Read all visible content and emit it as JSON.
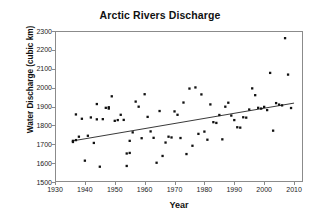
{
  "chart_data": {
    "type": "scatter",
    "title": "Arctic Rivers Discharge",
    "xlabel": "Year",
    "ylabel": "Water Discharge (cubic km)",
    "xlim": [
      1930,
      2013
    ],
    "ylim": [
      1500,
      2300
    ],
    "xticks": [
      1930,
      1940,
      1950,
      1960,
      1970,
      1980,
      1990,
      2000,
      2010
    ],
    "yticks": [
      1500,
      1600,
      1700,
      1800,
      1900,
      2000,
      2100,
      2200,
      2300
    ],
    "grid": false,
    "legend": null,
    "marker_color": "#111111",
    "marker_shape": "square",
    "frame_color": "#8b8b8b",
    "series": [
      {
        "name": "Annual discharge",
        "x": [
          1936,
          1936,
          1937,
          1937,
          1938,
          1939,
          1940,
          1941,
          1942,
          1943,
          1944,
          1944,
          1945,
          1946,
          1947,
          1948,
          1948,
          1949,
          1950,
          1951,
          1952,
          1953,
          1954,
          1954,
          1955,
          1955,
          1956,
          1957,
          1958,
          1959,
          1960,
          1961,
          1962,
          1963,
          1964,
          1965,
          1966,
          1967,
          1968,
          1969,
          1970,
          1971,
          1972,
          1973,
          1974,
          1975,
          1976,
          1977,
          1978,
          1979,
          1980,
          1981,
          1982,
          1983,
          1984,
          1985,
          1986,
          1987,
          1988,
          1989,
          1990,
          1991,
          1992,
          1993,
          1994,
          1995,
          1996,
          1997,
          1998,
          1999,
          2000,
          2001,
          2002,
          2003,
          2004,
          2005,
          2006,
          2007,
          2008,
          2009
        ],
        "y": [
          1718,
          1712,
          1722,
          1858,
          1740,
          1835,
          1613,
          1745,
          1842,
          1707,
          1913,
          1832,
          1581,
          1833,
          1893,
          1896,
          1889,
          1954,
          1824,
          1828,
          1856,
          1829,
          1651,
          1585,
          1654,
          1718,
          1763,
          1926,
          1899,
          1732,
          1965,
          1845,
          1768,
          1734,
          1602,
          1876,
          1638,
          1709,
          1740,
          1736,
          1874,
          1856,
          1733,
          1921,
          1648,
          1995,
          1692,
          2001,
          1755,
          1964,
          1767,
          1724,
          1911,
          1817,
          1813,
          1855,
          1726,
          1899,
          1920,
          1852,
          1828,
          1790,
          1788,
          1843,
          1841,
          1884,
          1996,
          1960,
          1893,
          1889,
          1898,
          1881,
          2078,
          1772,
          1918,
          1910,
          1906,
          2262,
          2069,
          1892
        ],
        "y_extra_note": "1936-2009 annual values, cubic km"
      }
    ],
    "trendline": {
      "name": "linear fit",
      "x_start": 1936,
      "y_start": 1718,
      "x_end": 2010,
      "y_end": 1918,
      "color": "#222222"
    }
  },
  "axes": {
    "title": "Arctic Rivers Discharge",
    "x_label": "Year",
    "y_label": "Water Discharge (cubic km)",
    "x_tick_labels": [
      "1930",
      "1940",
      "1950",
      "1960",
      "1970",
      "1980",
      "1990",
      "2000",
      "2010"
    ],
    "y_tick_labels": [
      "1500",
      "1600",
      "1700",
      "1800",
      "1900",
      "2000",
      "2100",
      "2200",
      "2300"
    ]
  }
}
